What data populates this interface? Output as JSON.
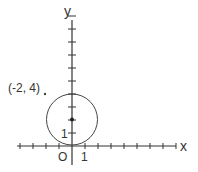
{
  "diagram": {
    "axes": {
      "x_label": "x",
      "y_label": "y",
      "origin_label": "O",
      "x_unit_label": "1",
      "y_unit_label": "1"
    },
    "circle": {
      "center": [
        0,
        2
      ],
      "radius": 2
    },
    "center_point": [
      0,
      2
    ],
    "point": {
      "coords": [
        -2,
        4
      ],
      "label": "(-2, 4)"
    },
    "x_ticks": [
      -4,
      -3,
      -2,
      -1,
      1,
      2,
      3,
      4,
      5,
      6,
      7,
      8
    ],
    "y_ticks": [
      1,
      2,
      3,
      4,
      5,
      6,
      7,
      8,
      9,
      10
    ]
  },
  "colors": {
    "line": "#333333"
  }
}
